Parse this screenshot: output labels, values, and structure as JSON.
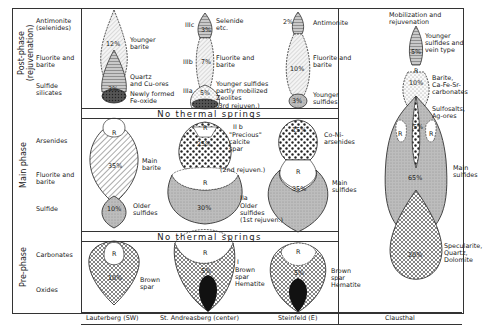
{
  "phases": {
    "post": {
      "label": "Post-phase",
      "sub": "(rejuvenation)"
    },
    "main": {
      "label": "Main phase"
    },
    "pre": {
      "label": "Pre-phase"
    }
  },
  "rows": {
    "antimonite": "Antimonite\n(selenides)",
    "fluorite_post": "Fluorite and\nbarite",
    "sulfide_silicates": "Sulfide\nsilicates",
    "arsenides": "Arsenides",
    "fluorite_main": "Fluorite and\nbarite",
    "sulfide": "Sulfide",
    "carbonates": "Carbonates",
    "oxides": "Oxides"
  },
  "banners": {
    "upper": "No thermal springs",
    "lower": "No thermal springs"
  },
  "columns": [
    {
      "name": "Lauterberg (SW)"
    },
    {
      "name": "St. Andreasberg (center)"
    },
    {
      "name": "Steinfeld (E)"
    },
    {
      "name": "Clausthal"
    }
  ],
  "lauterberg": {
    "post": {
      "pct_top": "12%",
      "label_top": "Younger\nbarite",
      "pct_mid": "3%",
      "label_mid": "Quartz\nand Cu-ores",
      "label_bot": "Newly formed\nFe-oxide"
    },
    "main": {
      "r": "R",
      "pct": "35%",
      "label": "Main\nbarite",
      "pct_low": "10%",
      "label_low": "Older\nsulfides"
    },
    "pre": {
      "r": "R",
      "pct": "10%",
      "label": "Brown\nspar"
    }
  },
  "andreasberg": {
    "post": {
      "IIIc": "IIIc",
      "pct_c": "3%",
      "label_c": "Selenide\netc.",
      "IIIb": "IIIb",
      "pct_b": "7%",
      "label_b": "Fluorite and\nbarite",
      "IIIa": "IIIa",
      "pct_a": "5%",
      "label_a": "Younger sulfides\npartly mobilized\nZeolites\n(3rd rejuven.)"
    },
    "main": {
      "IIb": "II b",
      "r_top": "R",
      "pct_b": "25%",
      "label_b": "\"Precious\"\ncalcite\nspar",
      "rejuv2": "(2nd rejuven.)",
      "r_low": "R",
      "IIa": "IIa",
      "pct_a": "30%",
      "label_a": "Older\nsulfides\n(1st rejuven.)"
    },
    "pre": {
      "r": "R",
      "roman": "I",
      "pct": "5%",
      "label": "Brown\nspar\nHematite"
    }
  },
  "steinfeld": {
    "post": {
      "pct_top": "2%",
      "label_top": "Antimonite",
      "pct_mid": "10%",
      "label_mid": "Fluorite and\nbarite",
      "pct_bot": "3%",
      "label_bot": "Younger\nsulfides"
    },
    "main": {
      "pct_top": "15%",
      "label_top": "Co-Ni-\narsenides",
      "r": "R",
      "pct": "35%",
      "label": "Main\nsulfides"
    },
    "pre": {
      "r": "R",
      "pct": "5%",
      "label": "Brown\nspar\nHematite"
    }
  },
  "clausthal": {
    "header": "Mobilization and\nrejuvenation",
    "pct_top": "5%",
    "label_top": "Younger\nsulfides and\nvein type",
    "r_top": "R",
    "pct_barite": "10%",
    "label_barite": "Barite,\nCa-Fe-Sr-\ncarbonates",
    "pct_sulfosalt": "5%",
    "label_sulfosalt": "Sulfosalts,\nAg-ores",
    "r_left": "R",
    "r_right": "R",
    "pct_main": "65%",
    "label_main": "Main\nsulfides",
    "pct_spec": "20%",
    "label_spec": "Specularite,\nQuartz,\nDolomite"
  }
}
